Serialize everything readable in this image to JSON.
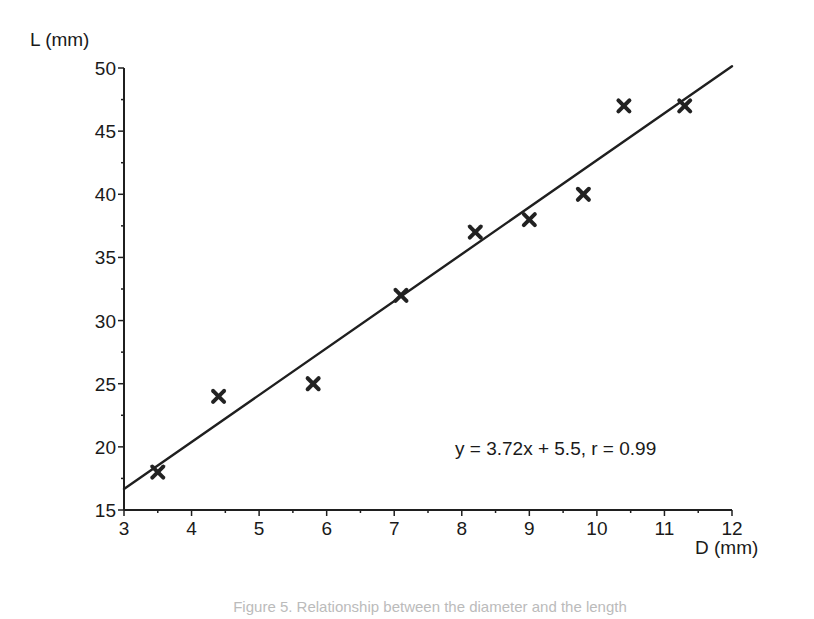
{
  "chart_data": {
    "type": "scatter",
    "title": "",
    "xlabel": "D (mm)",
    "ylabel": "L (mm)",
    "xlim": [
      3,
      12
    ],
    "ylim": [
      15,
      50
    ],
    "x_ticks": [
      3,
      4,
      5,
      6,
      7,
      8,
      9,
      10,
      11,
      12
    ],
    "y_ticks": [
      15,
      20,
      25,
      30,
      35,
      40,
      45,
      50
    ],
    "x_minor_step": 0.5,
    "y_minor_step": 2.5,
    "grid": false,
    "legend": null,
    "marker": "x",
    "series": [
      {
        "name": "measurements",
        "points": [
          {
            "x": 3.5,
            "y": 18
          },
          {
            "x": 4.4,
            "y": 24
          },
          {
            "x": 5.8,
            "y": 25
          },
          {
            "x": 7.1,
            "y": 32
          },
          {
            "x": 8.2,
            "y": 37
          },
          {
            "x": 9.0,
            "y": 38
          },
          {
            "x": 9.8,
            "y": 40
          },
          {
            "x": 10.4,
            "y": 47
          },
          {
            "x": 11.3,
            "y": 47
          }
        ]
      }
    ],
    "fit_line": {
      "slope": 3.72,
      "intercept": 5.5,
      "x_range": [
        3,
        12
      ],
      "r": 0.99
    },
    "annotations": [
      {
        "text": "y = 3.72x + 5.5, r = 0.99",
        "x": 9.0,
        "y": 19.7
      }
    ]
  },
  "caption": "Figure 5. Relationship between the diameter and the length"
}
